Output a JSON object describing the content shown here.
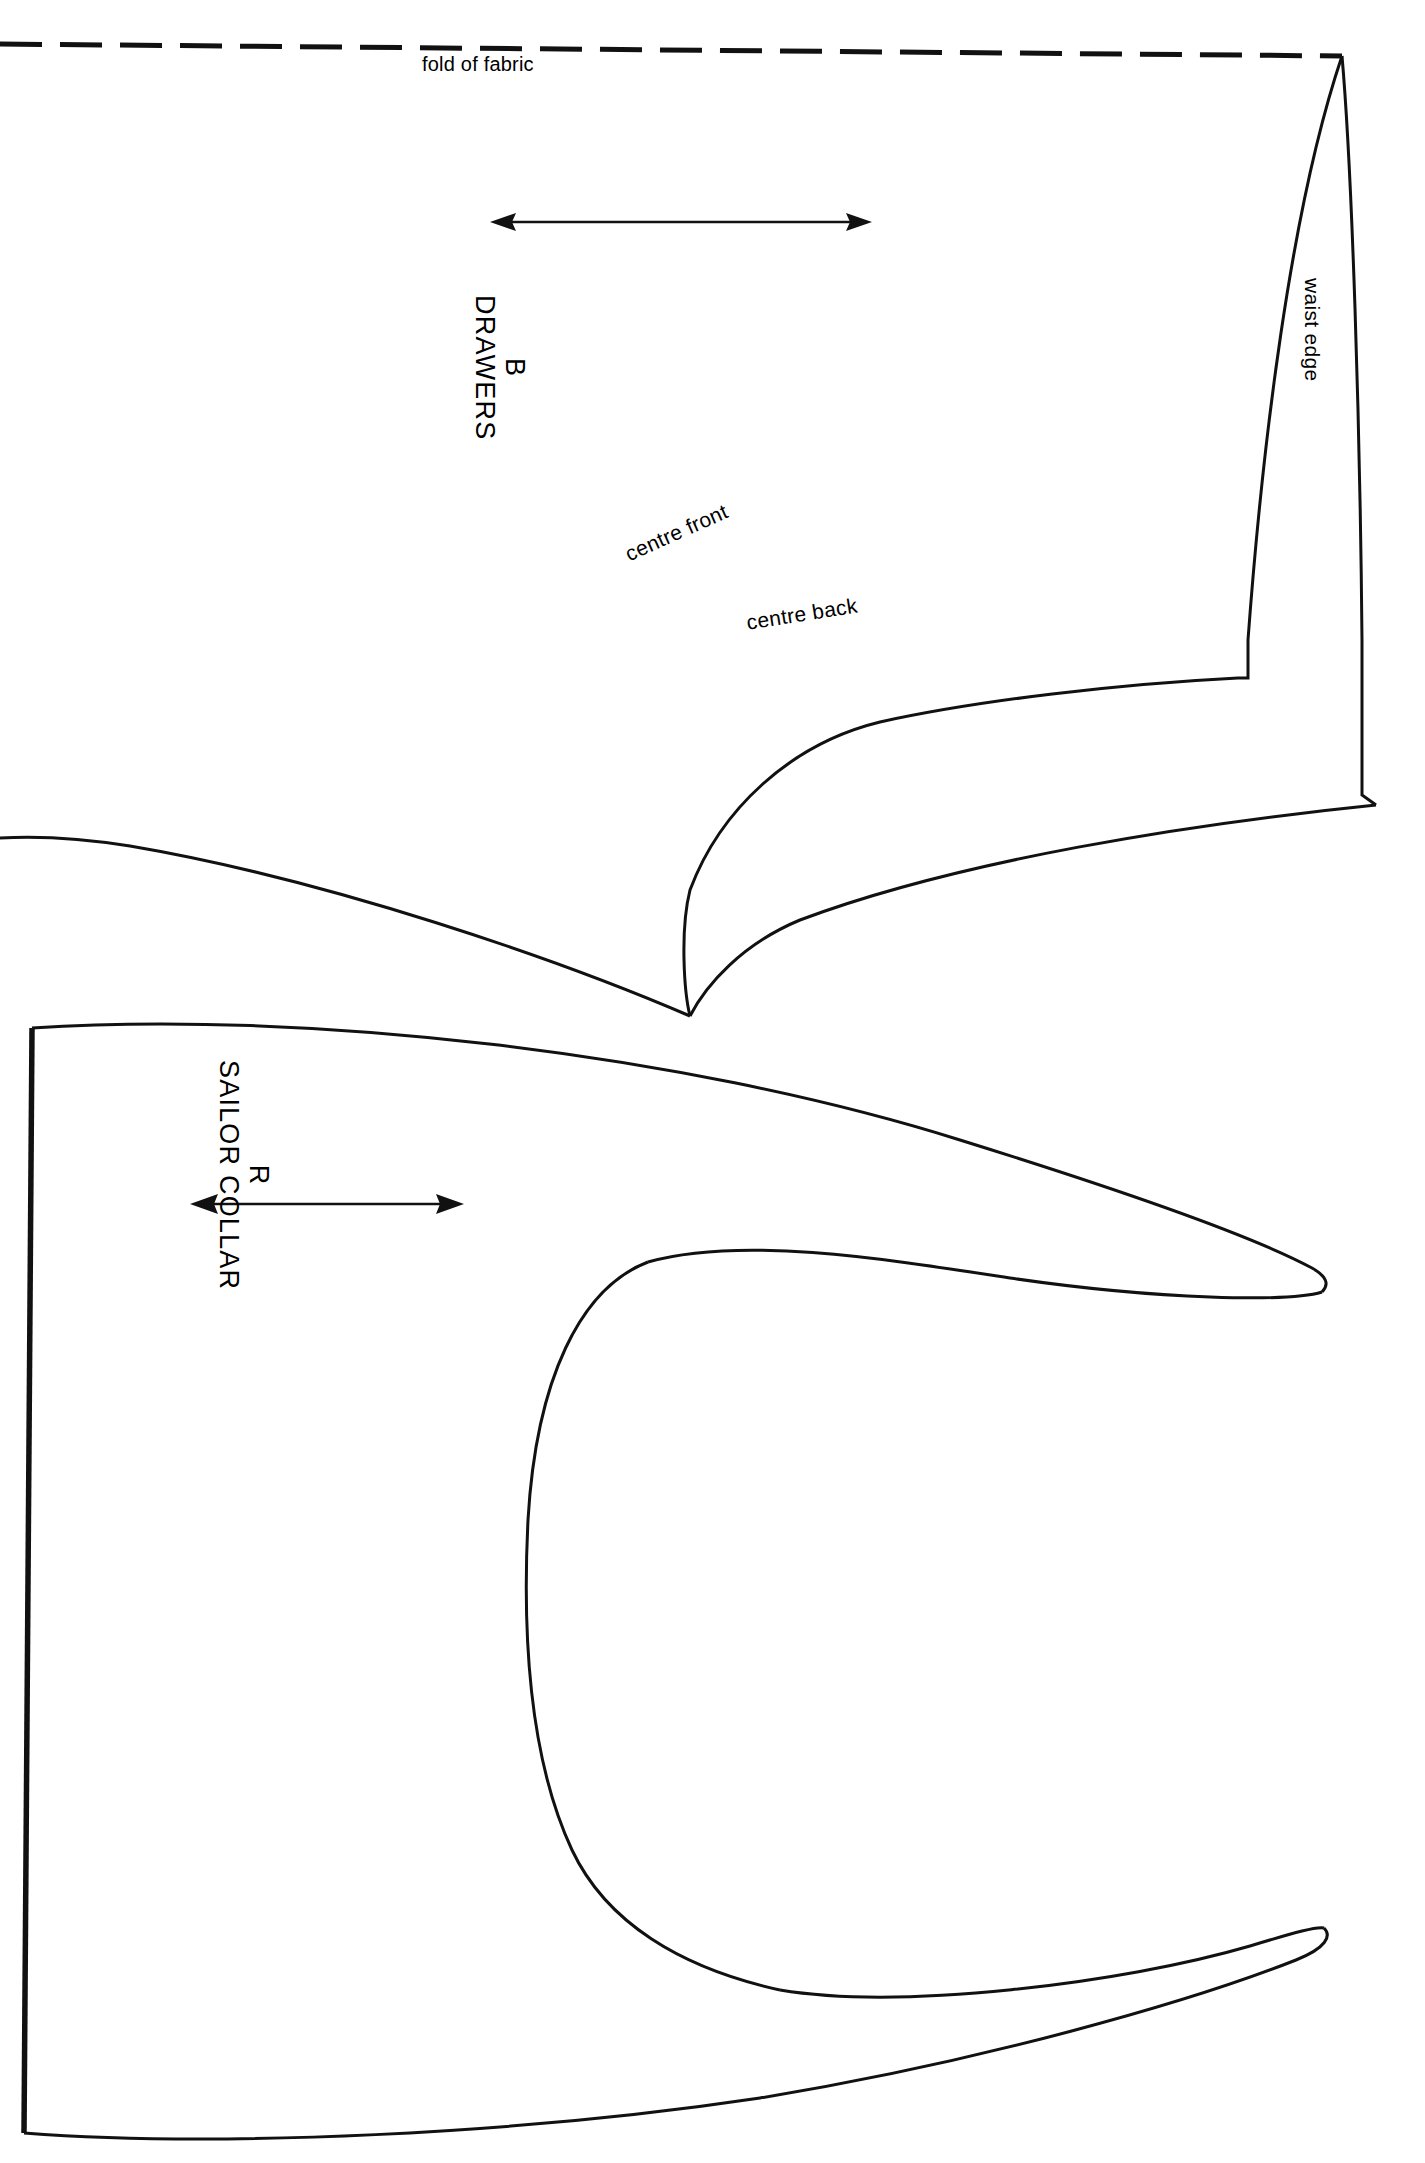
{
  "sheet": {
    "title": "Pattern sheet",
    "background_color": "#ffffff",
    "ink_color": "#111111",
    "width": 1425,
    "height": 2163
  },
  "fold": {
    "label": "fold of fabric",
    "style": "dashed"
  },
  "pieces": [
    {
      "id": "piece-b",
      "code": "B",
      "name": "DRAWERS",
      "grain_arrow": "double-headed-grain-arrow",
      "edges": [
        {
          "id": "waist-edge",
          "label": "waist edge"
        },
        {
          "id": "centre-front",
          "label": "centre front"
        },
        {
          "id": "centre-back",
          "label": "centre back"
        }
      ]
    },
    {
      "id": "piece-r",
      "code": "R",
      "name": "SAILOR COLLAR",
      "grain_arrow": "double-headed-grain-arrow",
      "edges": []
    }
  ],
  "labels": {
    "fold_of_fabric": "fold of fabric",
    "waist_edge": "waist edge",
    "centre_front": "centre front",
    "centre_back": "centre back",
    "piece_b_code": "B",
    "piece_b_name": "DRAWERS",
    "piece_r_code": "R",
    "piece_r_name": "SAILOR COLLAR"
  },
  "icons": {
    "grain_arrow_drawers": "grain-arrow-icon",
    "grain_arrow_collar": "grain-arrow-icon",
    "fold_line": "fold-line-icon"
  }
}
